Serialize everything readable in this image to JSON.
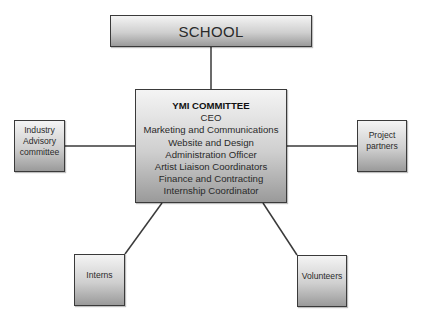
{
  "diagram": {
    "top": {
      "label": "SCHOOL"
    },
    "center": {
      "title": "YMI COMMITTEE",
      "roles": [
        "CEO",
        "Marketing and Communications",
        "Website and Design",
        "Administration Officer",
        "Artist Liaison Coordinators",
        "Finance and Contracting",
        "Internship Coordinator"
      ]
    },
    "left": {
      "lines": [
        "Industry",
        "Advisory",
        "committee"
      ]
    },
    "right": {
      "lines": [
        "Project",
        "partners"
      ]
    },
    "bottom_left": {
      "label": "Interns"
    },
    "bottom_right": {
      "label": "Volunteers"
    },
    "colors": {
      "border": "#3a3a3a",
      "fill_top": "#f4f4f4",
      "fill_bottom": "#9a9a9a",
      "line": "#3a3a3a"
    },
    "connections": [
      {
        "from": "SCHOOL",
        "to": "YMI COMMITTEE"
      },
      {
        "from": "Industry Advisory committee",
        "to": "YMI COMMITTEE"
      },
      {
        "from": "Project partners",
        "to": "YMI COMMITTEE"
      },
      {
        "from": "Interns",
        "to": "YMI COMMITTEE"
      },
      {
        "from": "Volunteers",
        "to": "YMI COMMITTEE"
      }
    ]
  }
}
